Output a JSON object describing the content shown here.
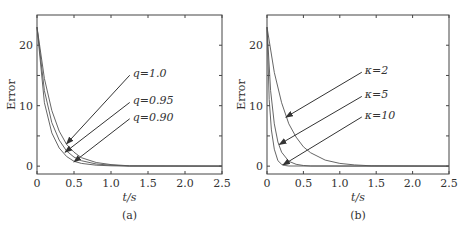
{
  "chart_data": [
    {
      "type": "line",
      "panel": "a",
      "caption": "(a)",
      "title": "",
      "xlabel": "t/s",
      "ylabel": "Error",
      "xlim": [
        0,
        2.5
      ],
      "ylim": [
        -1.3,
        25
      ],
      "xticks": [
        "0",
        "0.5",
        "1.0",
        "1.5",
        "2.0",
        "2.5"
      ],
      "yticks": [
        "0",
        "10",
        "20"
      ],
      "grid": false,
      "series": [
        {
          "name": "q=1.0",
          "x": [
            0,
            0.1,
            0.2,
            0.3,
            0.4,
            0.5,
            0.6,
            0.8,
            1.0,
            1.25,
            2.5
          ],
          "y": [
            23,
            14.5,
            9.2,
            5.8,
            3.6,
            2.3,
            1.4,
            0.6,
            0.25,
            0.05,
            0
          ]
        },
        {
          "name": "q=0.95",
          "x": [
            0,
            0.1,
            0.2,
            0.3,
            0.4,
            0.5,
            0.6,
            0.8,
            1.0,
            1.25,
            2.5
          ],
          "y": [
            23,
            12.5,
            7.2,
            4.3,
            2.5,
            1.5,
            0.9,
            0.35,
            0.15,
            0.03,
            0
          ]
        },
        {
          "name": "q=0.90",
          "x": [
            0,
            0.1,
            0.2,
            0.3,
            0.4,
            0.5,
            0.6,
            0.8,
            1.0,
            1.25,
            2.5
          ],
          "y": [
            23,
            10.5,
            5.5,
            3.0,
            1.6,
            0.8,
            0.45,
            0.15,
            0.05,
            0.0,
            0
          ]
        }
      ],
      "annotations": [
        {
          "text": "q=1.0",
          "label_xy": [
            1.28,
            15.2
          ],
          "arrow_to": [
            0.4,
            3.7
          ]
        },
        {
          "text": "q=0.95",
          "label_xy": [
            1.28,
            10.7
          ],
          "arrow_to": [
            0.38,
            2.3
          ]
        },
        {
          "text": "q=0.90",
          "label_xy": [
            1.28,
            8.0
          ],
          "arrow_to": [
            0.5,
            0.7
          ]
        }
      ]
    },
    {
      "type": "line",
      "panel": "b",
      "caption": "(b)",
      "title": "",
      "xlabel": "t/s",
      "ylabel": "Error",
      "xlim": [
        0,
        2.5
      ],
      "ylim": [
        -1.3,
        25
      ],
      "xticks": [
        "0",
        "0.5",
        "1.0",
        "1.5",
        "2.0",
        "2.5"
      ],
      "yticks": [
        "0",
        "10",
        "20"
      ],
      "grid": false,
      "series": [
        {
          "name": "κ=2",
          "x": [
            0,
            0.1,
            0.2,
            0.3,
            0.4,
            0.5,
            0.6,
            0.8,
            1.0,
            1.2,
            1.43,
            2.5
          ],
          "y": [
            23,
            15.5,
            10.5,
            7.0,
            4.8,
            3.2,
            2.2,
            1.0,
            0.45,
            0.2,
            0.05,
            0
          ]
        },
        {
          "name": "κ=5",
          "x": [
            0,
            0.05,
            0.1,
            0.15,
            0.2,
            0.3,
            0.4,
            0.5,
            0.6,
            2.5
          ],
          "y": [
            23,
            12.5,
            7.0,
            4.0,
            2.3,
            0.8,
            0.3,
            0.1,
            0.03,
            0
          ]
        },
        {
          "name": "κ=10",
          "x": [
            0,
            0.03,
            0.06,
            0.1,
            0.15,
            0.2,
            0.25,
            0.3,
            2.5
          ],
          "y": [
            23,
            11,
            6,
            2.8,
            0.9,
            0.3,
            0.1,
            0.03,
            0
          ]
        }
      ],
      "annotations": [
        {
          "text": "κ=2",
          "label_xy": [
            1.33,
            15.7
          ],
          "arrow_to": [
            0.26,
            8.1
          ]
        },
        {
          "text": "κ=5",
          "label_xy": [
            1.33,
            11.7
          ],
          "arrow_to": [
            0.17,
            3.6
          ]
        },
        {
          "text": "κ=10",
          "label_xy": [
            1.33,
            8.3
          ],
          "arrow_to": [
            0.22,
            0.2
          ]
        }
      ]
    }
  ],
  "panels": {
    "a": {
      "caption": "(a)",
      "xlabel": "t/s",
      "ylabel": "Error",
      "labels": [
        "q=1.0",
        "q=0.95",
        "q=0.90"
      ]
    },
    "b": {
      "caption": "(b)",
      "xlabel": "t/s",
      "ylabel": "Error",
      "labels": [
        "κ=2",
        "κ=5",
        "κ=10"
      ]
    }
  }
}
